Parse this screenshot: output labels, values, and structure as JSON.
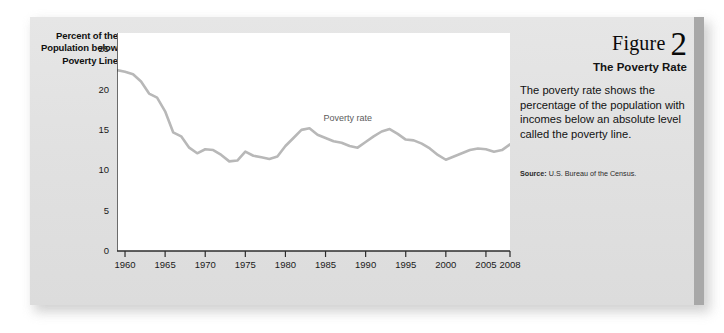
{
  "figure": {
    "label_word": "Figure",
    "number": "2",
    "title": "The Poverty Rate",
    "body": "The poverty rate shows the percentage of the population with incomes below an absolute level called the poverty line.",
    "source_label": "Source:",
    "source_text": "U.S. Bureau of the Census."
  },
  "colors": {
    "panel_background": "#e3e3e3",
    "plot_background": "#ffffff",
    "line": "#b8b8b8",
    "axis": "#2b2b2b",
    "accent_bar": "#a8a8a8",
    "text": "#121212"
  },
  "chart_data": {
    "type": "line",
    "title": "",
    "xlabel": "",
    "ylabel": "Percent of the Population below Poverty Line",
    "xlim": [
      1959,
      2008
    ],
    "ylim": [
      0,
      27
    ],
    "grid": false,
    "legend_position": "inline-annotation",
    "annotations": [
      {
        "text": "Poverty rate",
        "x": 1988,
        "y": 16.3
      }
    ],
    "yticks": [
      0,
      5,
      10,
      15,
      20,
      25
    ],
    "ytick_labels": [
      "0",
      "5",
      "10",
      "15",
      "20",
      "25"
    ],
    "xticks": [
      1960,
      1965,
      1970,
      1975,
      1980,
      1985,
      1990,
      1995,
      2000,
      2005,
      2008
    ],
    "xtick_labels": [
      "1960",
      "1965",
      "1970",
      "1975",
      "1980",
      "1985",
      "1990",
      "1995",
      "2000",
      "2005",
      "2008"
    ],
    "series": [
      {
        "name": "Poverty rate",
        "x": [
          1959,
          1960,
          1961,
          1962,
          1963,
          1964,
          1965,
          1966,
          1967,
          1968,
          1969,
          1970,
          1971,
          1972,
          1973,
          1974,
          1975,
          1976,
          1977,
          1978,
          1979,
          1980,
          1981,
          1982,
          1983,
          1984,
          1985,
          1986,
          1987,
          1988,
          1989,
          1990,
          1991,
          1992,
          1993,
          1994,
          1995,
          1996,
          1997,
          1998,
          1999,
          2000,
          2001,
          2002,
          2003,
          2004,
          2005,
          2006,
          2007,
          2008
        ],
        "values": [
          22.4,
          22.2,
          21.9,
          21.0,
          19.5,
          19.0,
          17.3,
          14.7,
          14.2,
          12.8,
          12.1,
          12.6,
          12.5,
          11.9,
          11.1,
          11.2,
          12.3,
          11.8,
          11.6,
          11.4,
          11.7,
          13.0,
          14.0,
          15.0,
          15.2,
          14.4,
          14.0,
          13.6,
          13.4,
          13.0,
          12.8,
          13.5,
          14.2,
          14.8,
          15.1,
          14.5,
          13.8,
          13.7,
          13.3,
          12.7,
          11.9,
          11.3,
          11.7,
          12.1,
          12.5,
          12.7,
          12.6,
          12.3,
          12.5,
          13.2
        ]
      }
    ]
  }
}
